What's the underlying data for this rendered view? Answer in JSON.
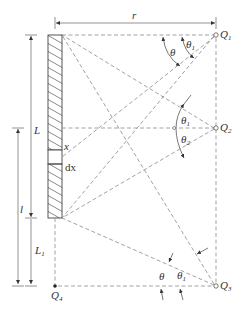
{
  "diagram": {
    "type": "geometry-figure",
    "labels": {
      "r": "r",
      "L": "L",
      "l": "l",
      "L1": "L",
      "L1_sub": "1",
      "x": "x",
      "dx": "dx",
      "Q1": "Q",
      "Q1_sub": "1",
      "Q2": "Q",
      "Q2_sub": "2",
      "Q3": "Q",
      "Q3_sub": "3",
      "Q4": "Q",
      "Q4_sub": "4",
      "theta": "θ",
      "theta1": "θ",
      "theta1_sub": "1",
      "theta2": "θ",
      "theta2_sub": "2"
    },
    "points": [
      {
        "name": "Q1",
        "position": "top-right, level with source top end"
      },
      {
        "name": "Q2",
        "position": "right, level with point x on source"
      },
      {
        "name": "Q3",
        "position": "bottom-right, below source"
      },
      {
        "name": "Q4",
        "position": "bottom-left, directly below source"
      }
    ],
    "angles": [
      {
        "at": "Q1",
        "labels": [
          "θ",
          "θ1"
        ]
      },
      {
        "at": "Q2",
        "labels": [
          "θ1",
          "θ2"
        ]
      },
      {
        "at": "Q3",
        "labels": [
          "θ",
          "θ1"
        ]
      }
    ],
    "dimensions": [
      "r",
      "L",
      "l",
      "L1"
    ]
  }
}
